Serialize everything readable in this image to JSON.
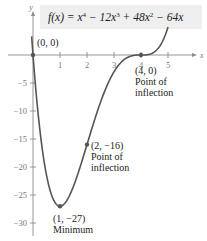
{
  "chart_data": {
    "type": "line",
    "title_parts": {
      "f": "f",
      "open": "(x) = x",
      "e4": "4",
      "t2": " − 12x",
      "e3": "3",
      "t3": " + 48x",
      "e2": "2",
      "t4": " − 64x"
    },
    "function": "x^4 - 12x^3 + 48x^2 - 64x",
    "xlabel": "x",
    "ylabel": "y",
    "xlim": [
      -0.3,
      5.7
    ],
    "ylim": [
      -32,
      10
    ],
    "x_ticks": [
      1,
      2,
      3,
      4,
      5
    ],
    "x_tick_labels": [
      "1",
      "2",
      "3",
      "4",
      "5"
    ],
    "y_ticks": [
      -5,
      -10,
      -15,
      -20,
      -25,
      -30
    ],
    "y_tick_labels": [
      "−5",
      "−10",
      "−15",
      "−20",
      "−25",
      "−30"
    ],
    "x_domain_plotted": [
      -0.05,
      5.0
    ],
    "grid": false,
    "series": [
      {
        "name": "f(x)",
        "color": "#555555"
      }
    ],
    "points": [
      {
        "x": 0,
        "y": 0,
        "label": "(0, 0)",
        "note": ""
      },
      {
        "x": 4,
        "y": 0,
        "label": "(4, 0)",
        "note": "Point of\ninflection",
        "note_lines": [
          "Point of",
          "inflection"
        ]
      },
      {
        "x": 2,
        "y": -16,
        "label": "(2, −16)",
        "note_lines": [
          "Point of",
          "inflection"
        ]
      },
      {
        "x": 1,
        "y": -27,
        "label": "(1, −27)",
        "note_lines": [
          "Minimum"
        ]
      }
    ]
  }
}
